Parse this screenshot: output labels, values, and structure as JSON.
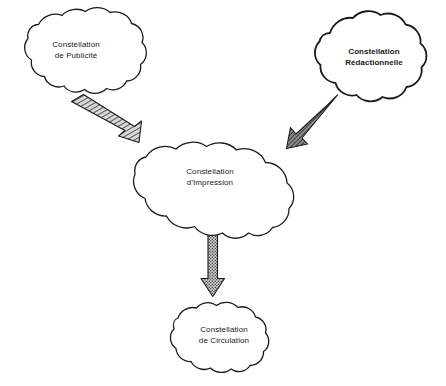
{
  "diagram": {
    "background_color": "#ffffff",
    "stroke_color": "#1b1b1b",
    "arrow_fill_color": "#8c8c8c",
    "nodes": [
      {
        "id": "publicite",
        "shape": "cloud",
        "emphasis": "regular",
        "label_line1": "Constellation",
        "label_line2": "de Publicité"
      },
      {
        "id": "redactionnelle",
        "shape": "cloud",
        "emphasis": "bold",
        "label_line1": "Constellation",
        "label_line2": "Rédactionnelle"
      },
      {
        "id": "impression",
        "shape": "cloud",
        "emphasis": "regular",
        "label_line1": "Constellation",
        "label_line2": "d'Impression"
      },
      {
        "id": "circulation",
        "shape": "cloud",
        "emphasis": "regular",
        "label_line1": "Constellation",
        "label_line2": "de Circulation"
      }
    ],
    "arrows": [
      {
        "id": "publicite-to-impression",
        "from": "publicite",
        "to": "impression",
        "direction": "down-right",
        "texture": "hatched"
      },
      {
        "id": "redactionnelle-to-impression",
        "from": "redactionnelle",
        "to": "impression",
        "direction": "down-left",
        "texture": "hatched-dense"
      },
      {
        "id": "impression-to-circulation",
        "from": "impression",
        "to": "circulation",
        "direction": "down",
        "texture": "stippled"
      }
    ]
  }
}
